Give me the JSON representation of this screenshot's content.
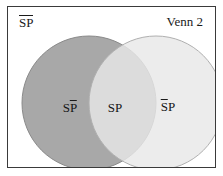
{
  "diagram": {
    "title": "Venn 2",
    "corner_label": {
      "text": "SP",
      "notation": "overline-both",
      "s": "S",
      "p": "P"
    },
    "frame": {
      "border_color": "#3a3a3a",
      "background_color": "#ffffff"
    },
    "outer_background_color": "#ffffff",
    "regions": [
      {
        "name": "left-only",
        "label_s": "S",
        "label_p": "P",
        "notation": "overline-p",
        "fill_color": "#a8a8a8",
        "stroke_color": "#8a8a8a"
      },
      {
        "name": "intersection",
        "label_s": "S",
        "label_p": "P",
        "notation": "none",
        "fill_color": "#d4d4d4",
        "stroke_color": "#9a9a9a"
      },
      {
        "name": "right-only",
        "label_s": "S",
        "label_p": "P",
        "notation": "overline-s",
        "fill_color": "#e8e8e8",
        "stroke_color": "#b0b0b0"
      }
    ]
  }
}
